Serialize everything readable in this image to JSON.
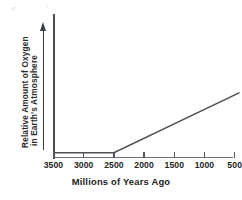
{
  "figure": {
    "name": "oxygen-in-earths-atmosphere-over-time"
  },
  "artifacts": [
    {
      "glyph": "c",
      "x": 12,
      "y": 8
    },
    {
      "glyph": "|",
      "x": 46,
      "y": 6
    }
  ],
  "chart_data": {
    "type": "line",
    "title": "",
    "xlabel": "Millions of Years Ago",
    "ylabel_line1": "Relative Amount of Oxygen",
    "ylabel_line2": "in Earth's Atmosphere",
    "x_tick_labels": [
      "3500",
      "3000",
      "2500",
      "2000",
      "1500",
      "1000",
      "500"
    ],
    "x_tick_values": [
      3500,
      3000,
      2500,
      2000,
      1500,
      1000,
      500
    ],
    "x_axis_direction": "decreasing",
    "xlim": [
      3500,
      380
    ],
    "ylim": [
      0,
      1
    ],
    "y_tick_labels": [],
    "grid": false,
    "legend": null,
    "y_axis_arrow": "upward arrow indicating increasing relative amount of oxygen",
    "series": [
      {
        "name": "Relative amount of oxygen in Earth's atmosphere",
        "color": "#4d5155",
        "points": [
          {
            "x": 3500,
            "y": 0.03
          },
          {
            "x": 2500,
            "y": 0.03
          },
          {
            "x": 420,
            "y": 0.45
          }
        ],
        "description": "Flat near zero from 3500 to 2500 million years ago, then rising steadily to the present"
      }
    ],
    "annotations": [
      {
        "text": "inflection point at 2500 million years ago",
        "x": 2500,
        "y": 0.03
      }
    ]
  }
}
